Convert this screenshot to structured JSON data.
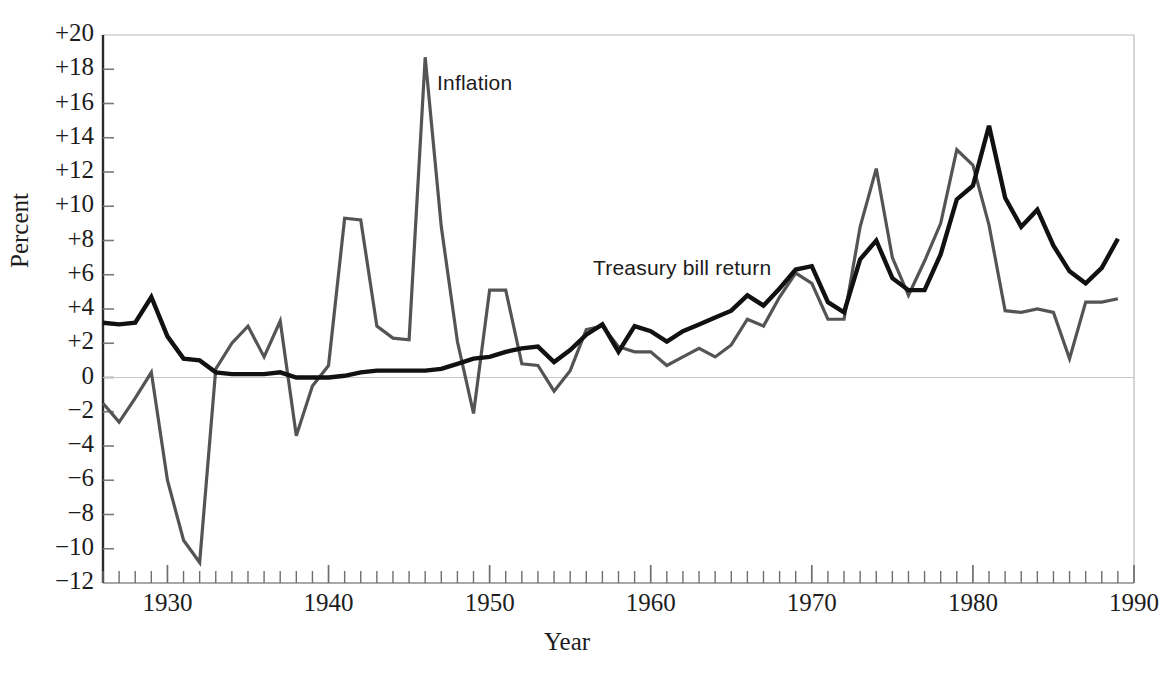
{
  "chart_data": {
    "type": "line",
    "title": "",
    "xlabel": "Year",
    "ylabel": "Percent",
    "xlim": [
      1926,
      1990
    ],
    "ylim": [
      -12,
      20
    ],
    "xticks_major": [
      1930,
      1940,
      1950,
      1960,
      1970,
      1980,
      1990
    ],
    "xtick_labels": [
      "1930",
      "1940",
      "1950",
      "1960",
      "1970",
      "1980",
      "1990"
    ],
    "xtick_minor_step": 1,
    "yticks": [
      20,
      18,
      16,
      14,
      12,
      10,
      8,
      6,
      4,
      2,
      0,
      -2,
      -4,
      -6,
      -8,
      -10,
      -12
    ],
    "ytick_labels": [
      "+20",
      "+18",
      "+16",
      "+14",
      "+12",
      "+10",
      "+8",
      "+6",
      "+4",
      "+2",
      "0",
      "−2",
      "−4",
      "−6",
      "−8",
      "−10",
      "−12"
    ],
    "grid": false,
    "zero_line": true,
    "legend_position": "inline-annotations",
    "x": [
      1926,
      1927,
      1928,
      1929,
      1930,
      1931,
      1932,
      1933,
      1934,
      1935,
      1936,
      1937,
      1938,
      1939,
      1940,
      1941,
      1942,
      1943,
      1944,
      1945,
      1946,
      1947,
      1948,
      1949,
      1950,
      1951,
      1952,
      1953,
      1954,
      1955,
      1956,
      1957,
      1958,
      1959,
      1960,
      1961,
      1962,
      1963,
      1964,
      1965,
      1966,
      1967,
      1968,
      1969,
      1970,
      1971,
      1972,
      1973,
      1974,
      1975,
      1976,
      1977,
      1978,
      1979,
      1980,
      1981,
      1982,
      1983,
      1984,
      1985,
      1986,
      1987,
      1988,
      1989
    ],
    "series": [
      {
        "name": "Inflation",
        "color": "#545454",
        "width": 3.2,
        "values": [
          -1.5,
          -2.6,
          -1.2,
          0.3,
          -6.0,
          -9.5,
          -10.8,
          0.5,
          2.0,
          3.0,
          1.2,
          3.3,
          -3.4,
          -0.5,
          0.7,
          9.3,
          9.2,
          3.0,
          2.3,
          2.2,
          18.7,
          8.8,
          2.1,
          -2.1,
          5.1,
          5.1,
          0.8,
          0.7,
          -0.8,
          0.4,
          2.8,
          3.0,
          1.8,
          1.5,
          1.5,
          0.7,
          1.2,
          1.7,
          1.2,
          1.9,
          3.4,
          3.0,
          4.7,
          6.1,
          5.5,
          3.4,
          3.4,
          8.8,
          12.2,
          7.0,
          4.8,
          6.8,
          9.0,
          13.3,
          12.4,
          8.9,
          3.9,
          3.8,
          4.0,
          3.8,
          1.1,
          4.4,
          4.4,
          4.6
        ]
      },
      {
        "name": "Treasury bill return",
        "color": "#111111",
        "width": 4.4,
        "values": [
          3.2,
          3.1,
          3.2,
          4.7,
          2.4,
          1.1,
          1.0,
          0.3,
          0.2,
          0.2,
          0.2,
          0.3,
          0.0,
          0.0,
          0.0,
          0.1,
          0.3,
          0.4,
          0.4,
          0.4,
          0.4,
          0.5,
          0.8,
          1.1,
          1.2,
          1.5,
          1.7,
          1.8,
          0.9,
          1.6,
          2.5,
          3.1,
          1.5,
          3.0,
          2.7,
          2.1,
          2.7,
          3.1,
          3.5,
          3.9,
          4.8,
          4.2,
          5.2,
          6.3,
          6.5,
          4.4,
          3.8,
          6.9,
          8.0,
          5.8,
          5.1,
          5.1,
          7.2,
          10.4,
          11.2,
          14.7,
          10.5,
          8.8,
          9.8,
          7.7,
          6.2,
          5.5,
          6.4,
          8.1
        ]
      }
    ],
    "annotations": [
      {
        "text": "Inflation",
        "x_px": 437,
        "y_px": 71
      },
      {
        "text": "Treasury bill return",
        "x_px": 593,
        "y_px": 256
      }
    ]
  },
  "axes": {
    "y_title": "Percent",
    "x_title": "Year"
  },
  "colors": {
    "inflation": "#545454",
    "tbill": "#111111",
    "axis": "#2a2a2a",
    "frame": "#b9b9b9",
    "zero_line": "#c7c7c7",
    "background": "#ffffff"
  }
}
